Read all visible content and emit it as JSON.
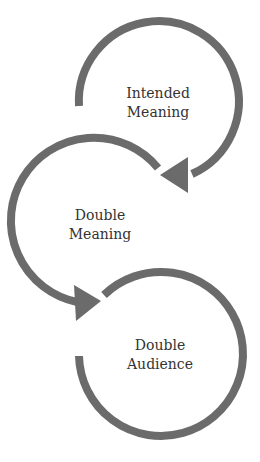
{
  "diagram": {
    "type": "cycle-flow",
    "stroke_color": "#6b6b6b",
    "text_color": "#333333",
    "nodes": [
      {
        "line1": "Intended",
        "line2": "Meaning"
      },
      {
        "line1": "Double",
        "line2": "Meaning"
      },
      {
        "line1": "Double",
        "line2": "Audience"
      }
    ],
    "edges": [
      {
        "from": "Intended Meaning",
        "to": "Double Meaning"
      },
      {
        "from": "Double Meaning",
        "to": "Double Audience"
      }
    ]
  }
}
